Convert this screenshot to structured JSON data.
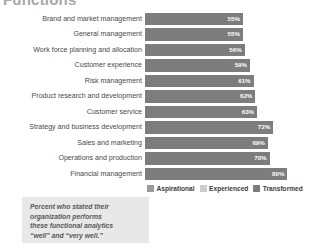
{
  "title": "Functions",
  "legend": {
    "position": "bottom",
    "items": [
      {
        "label": "Aspirational",
        "color": "#9a9a9a",
        "key": "aspirational"
      },
      {
        "label": "Experienced",
        "color": "#cccccc",
        "key": "experienced"
      },
      {
        "label": "Transformed",
        "color": "#7d7d7d",
        "key": "transformed"
      }
    ]
  },
  "footnote": {
    "lines": [
      "Percent who stated their",
      "organization performs",
      "these functional analytics",
      "“well” and “very well.”"
    ]
  },
  "chart_data": {
    "type": "bar",
    "orientation": "horizontal",
    "title": "Functions",
    "xlabel": "",
    "ylabel": "",
    "xlim": [
      0,
      100
    ],
    "grid": false,
    "legend_position": "bottom",
    "value_suffix": "%",
    "categories": [
      "Brand and market management",
      "General management",
      "Work force planning and allocation",
      "Customer experience",
      "Risk management",
      "Product research and development",
      "Customer service",
      "Strategy and business development",
      "Sales and marketing",
      "Operations and production",
      "Financial management"
    ],
    "series": [
      {
        "name": "Aspirational",
        "color": "#9a9a9a",
        "values": [
          null,
          null,
          null,
          null,
          null,
          null,
          null,
          null,
          34,
          35,
          49
        ]
      },
      {
        "name": "Experienced",
        "color": "#cccccc",
        "values": [
          null,
          null,
          null,
          null,
          null,
          43,
          45,
          54,
          54,
          57,
          67
        ]
      },
      {
        "name": "Transformed",
        "color": "#7d7d7d",
        "values": [
          55,
          55,
          56,
          59,
          61,
          62,
          63,
          72,
          69,
          70,
          80
        ]
      }
    ],
    "rows": [
      {
        "label": "Brand and market management",
        "aspirational": null,
        "aspirational_text": "",
        "experienced": null,
        "experienced_text": "",
        "transformed": 55,
        "transformed_text": "55%"
      },
      {
        "label": "General management",
        "aspirational": null,
        "aspirational_text": "",
        "experienced": null,
        "experienced_text": "",
        "transformed": 55,
        "transformed_text": "55%"
      },
      {
        "label": "Work force planning and allocation",
        "aspirational": null,
        "aspirational_text": "",
        "experienced": null,
        "experienced_text": "",
        "transformed": 56,
        "transformed_text": "56%"
      },
      {
        "label": "Customer experience",
        "aspirational": null,
        "aspirational_text": "",
        "experienced": null,
        "experienced_text": "",
        "transformed": 59,
        "transformed_text": "59%"
      },
      {
        "label": "Risk management",
        "aspirational": null,
        "aspirational_text": "",
        "experienced": null,
        "experienced_text": "",
        "transformed": 61,
        "transformed_text": "61%"
      },
      {
        "label": "Product research and development",
        "aspirational": null,
        "aspirational_text": "",
        "experienced": 43,
        "experienced_text": "43%",
        "transformed": 62,
        "transformed_text": "62%"
      },
      {
        "label": "Customer service",
        "aspirational": null,
        "aspirational_text": "",
        "experienced": 45,
        "experienced_text": "45%",
        "transformed": 63,
        "transformed_text": "63%"
      },
      {
        "label": "Strategy and business development",
        "aspirational": null,
        "aspirational_text": "",
        "experienced": 54,
        "experienced_text": "54%",
        "transformed": 72,
        "transformed_text": "72%"
      },
      {
        "label": "Sales and marketing",
        "aspirational": 34,
        "aspirational_text": "34%",
        "experienced": 54,
        "experienced_text": "54%",
        "transformed": 69,
        "transformed_text": "69%"
      },
      {
        "label": "Operations and production",
        "aspirational": 35,
        "aspirational_text": "35%",
        "experienced": 57,
        "experienced_text": "57%",
        "transformed": 70,
        "transformed_text": "70%"
      },
      {
        "label": "Financial management",
        "aspirational": 49,
        "aspirational_text": "49%",
        "experienced": 67,
        "experienced_text": "67%",
        "transformed": 80,
        "transformed_text": "80%"
      }
    ]
  }
}
